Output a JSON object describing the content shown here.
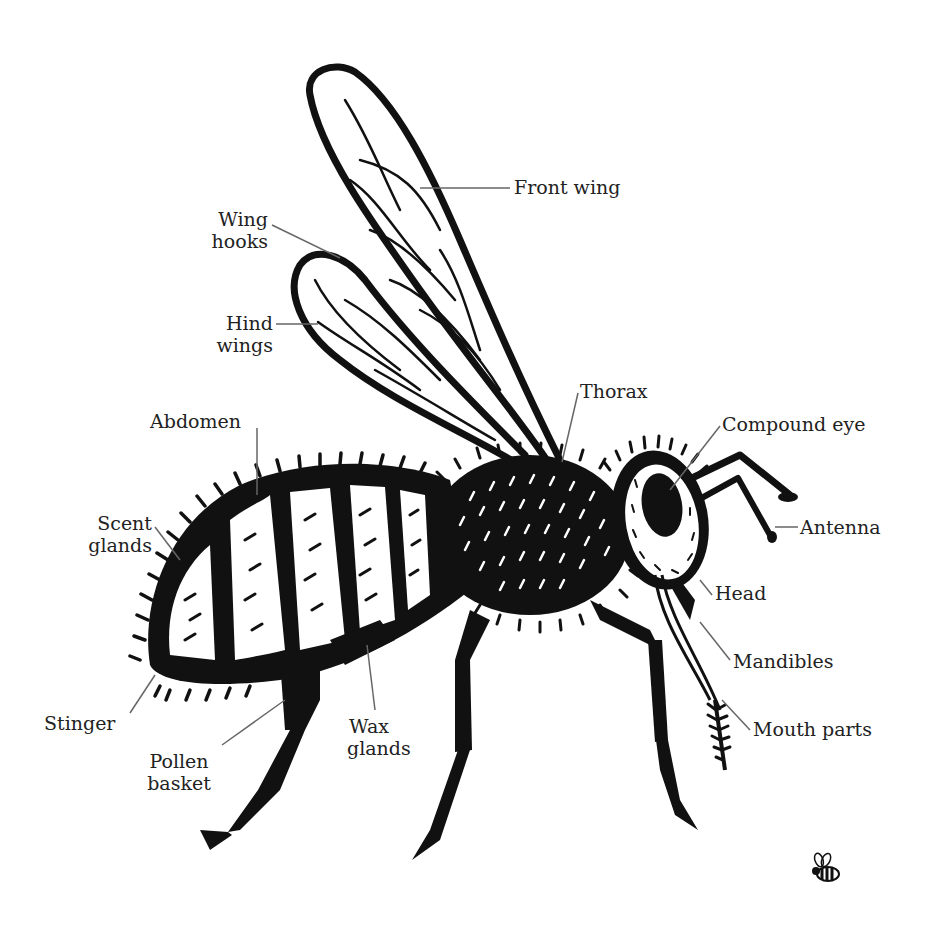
{
  "diagram": {
    "colors": {
      "ink": "#111111",
      "label": "#222222",
      "leader": "#666666",
      "background": "#ffffff"
    },
    "labels": [
      {
        "id": "front-wing",
        "text": "Front wing"
      },
      {
        "id": "wing-hooks",
        "line1": "Wing",
        "line2": "hooks"
      },
      {
        "id": "hind-wings",
        "line1": "Hind",
        "line2": "wings"
      },
      {
        "id": "thorax",
        "text": "Thorax"
      },
      {
        "id": "compound-eye",
        "text": "Compound eye"
      },
      {
        "id": "abdomen",
        "text": "Abdomen"
      },
      {
        "id": "antenna",
        "text": "Antenna"
      },
      {
        "id": "scent-glands",
        "line1": "Scent",
        "line2": "glands"
      },
      {
        "id": "head",
        "text": "Head"
      },
      {
        "id": "mandibles",
        "text": "Mandibles"
      },
      {
        "id": "stinger",
        "text": "Stinger"
      },
      {
        "id": "mouth-parts",
        "text": "Mouth parts"
      },
      {
        "id": "wax-glands",
        "line1": "Wax",
        "line2": "glands"
      },
      {
        "id": "pollen-basket",
        "line1": "Pollen",
        "line2": "basket"
      }
    ],
    "corner_icon": "small-bee-icon"
  }
}
